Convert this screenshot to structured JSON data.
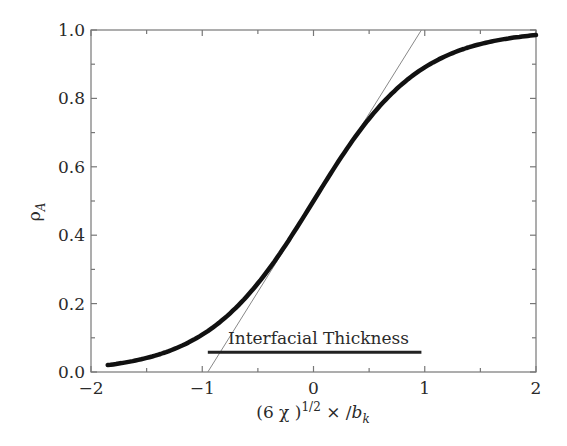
{
  "chart_data": {
    "type": "line",
    "title": "",
    "xlabel": "(6 χ )^{1/2} × /b_k",
    "xlabel_parts": {
      "prefix": "(6 χ )",
      "superscript": "1/2",
      "middle": " × /",
      "var": "b",
      "subscript": "k"
    },
    "ylabel": "ρ_A",
    "ylabel_parts": {
      "symbol": "ρ",
      "subscript": "A"
    },
    "xlim": [
      -2,
      2
    ],
    "ylim": [
      0.0,
      1.0
    ],
    "x_ticks": [
      -2,
      -1,
      0,
      1,
      2
    ],
    "x_tick_labels": [
      "−2",
      "−1",
      "0",
      "1",
      "2"
    ],
    "x_minor_ticks": [
      -1.5,
      -0.5,
      0.5,
      1.5
    ],
    "y_ticks": [
      0.0,
      0.2,
      0.4,
      0.6,
      0.8,
      1.0
    ],
    "y_tick_labels": [
      "0.0",
      "0.2",
      "0.4",
      "0.6",
      "0.8",
      "1.0"
    ],
    "y_minor_ticks": [
      0.1,
      0.3,
      0.5,
      0.7,
      0.9
    ],
    "grid": false,
    "legend": null,
    "series": [
      {
        "name": "density profile ρ_A",
        "style": "thick solid black",
        "x": [
          -1.85,
          -1.6,
          -1.4,
          -1.2,
          -1.0,
          -0.8,
          -0.6,
          -0.4,
          -0.2,
          0.0,
          0.2,
          0.4,
          0.6,
          0.8,
          1.0,
          1.2,
          1.4,
          1.6,
          1.8,
          2.0
        ],
        "y": [
          0.02,
          0.035,
          0.055,
          0.08,
          0.12,
          0.17,
          0.24,
          0.32,
          0.4,
          0.5,
          0.6,
          0.68,
          0.76,
          0.83,
          0.88,
          0.92,
          0.945,
          0.96,
          0.975,
          0.985
        ]
      },
      {
        "name": "tangent at midpoint",
        "style": "thin solid gray",
        "x": [
          -0.95,
          0.97
        ],
        "y": [
          0.0,
          1.0
        ]
      }
    ],
    "annotations": [
      {
        "text": "Interfacial Thickness",
        "x_center": 0.0,
        "y": 0.095
      },
      {
        "type": "bar",
        "x_start": -0.95,
        "x_end": 0.97,
        "y": 0.058,
        "style": "thick horizontal line"
      }
    ]
  }
}
